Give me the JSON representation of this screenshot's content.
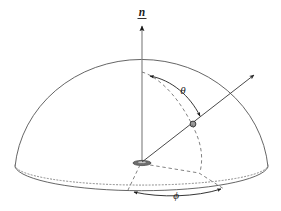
{
  "figure": {
    "background_color": "#ffffff",
    "line_color": "#4a4a4a",
    "dark_line_color": "#1a1a1a",
    "dashed_color": "#6b6b6b",
    "dotted_color": "#7a7a7a",
    "label_color": "#1a1a1a"
  },
  "labels": {
    "normal": "n",
    "theta": "θ",
    "phi": "ϕ"
  },
  "geometry": {
    "origin": {
      "x": 142,
      "y": 162
    },
    "base_ellipse": {
      "cx": 142,
      "cy": 162,
      "rx": 126,
      "ry": 20
    },
    "front_base_ellipse": {
      "cx": 142,
      "cy": 167,
      "rx": 126,
      "ry": 22
    },
    "dome_apex": {
      "x": 142,
      "y": 72
    },
    "normal_arrow_tip": {
      "x": 142,
      "y": 22
    },
    "surface_point": {
      "x": 193,
      "y": 124
    },
    "ray_tip": {
      "x": 258,
      "y": 71
    },
    "theta_label_pos": {
      "x": 183,
      "y": 92
    },
    "phi_label_pos": {
      "x": 176,
      "y": 196
    },
    "normal_label_pos": {
      "x": 142,
      "y": 14
    },
    "phi_arrow_left_tip": {
      "x": 128,
      "y": 193
    },
    "phi_arrow_right_tip": {
      "x": 226,
      "y": 190
    }
  }
}
